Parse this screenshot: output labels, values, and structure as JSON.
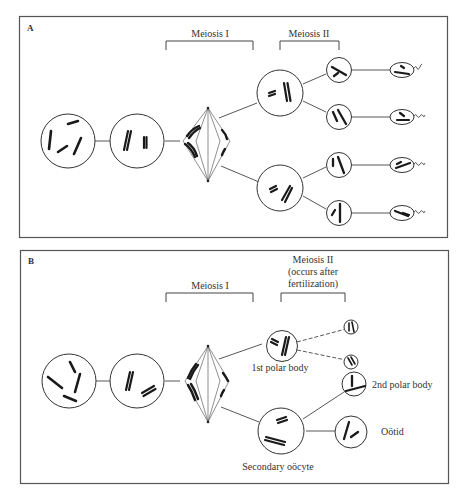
{
  "panels": [
    {
      "id": "A",
      "letter": "A",
      "subject": "spermatogenesis",
      "bracket_labels": {
        "meiosis1": "Meiosis I",
        "meiosis2": "Meiosis II"
      },
      "stages": [
        "primary cell",
        "replicated chromosomes",
        "metaphase I spindle",
        "secondary cells (2)",
        "spermatids (4)",
        "sperm (4)"
      ]
    },
    {
      "id": "B",
      "letter": "B",
      "subject": "oogenesis",
      "bracket_labels": {
        "meiosis1": "Meiosis I",
        "meiosis2_line1": "Meiosis II",
        "meiosis2_line2": "(occurs after",
        "meiosis2_line3": "fertilization)"
      },
      "cell_labels": {
        "first_polar_body": "1st polar body",
        "second_polar_body": "2nd polar body",
        "ootid": "Oötid",
        "secondary_oocyte": "Secondary oöcyte"
      }
    }
  ],
  "colors": {
    "line": "#333333",
    "chromosome": "#1a1a1a",
    "border": "#555555",
    "background": "#ffffff"
  }
}
